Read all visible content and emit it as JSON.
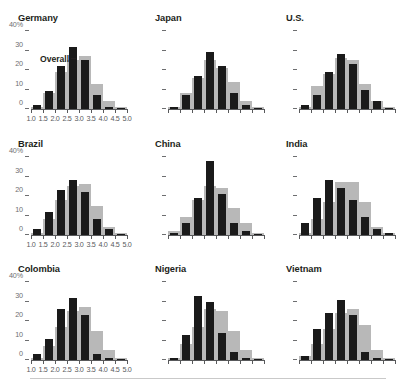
{
  "chart_data": {
    "type": "bar",
    "title": "",
    "xlabel": "",
    "ylabel": "",
    "ylim": [
      0,
      40
    ],
    "grid": false,
    "legend_position": "inline-annotation",
    "y_ticks": [
      {
        "value": 0,
        "label": "0"
      },
      {
        "value": 10,
        "label": "10"
      },
      {
        "value": 20,
        "label": "20"
      },
      {
        "value": 30,
        "label": "30"
      },
      {
        "value": 40,
        "label": "40%"
      }
    ],
    "x_ticks": [
      "1.0",
      "1.5",
      "2.0",
      "2.5",
      "3.0",
      "3.5",
      "4.0",
      "4.5",
      "5.0"
    ],
    "x_bins": [
      "1.0-1.5",
      "1.5-2.0",
      "2.0-2.5",
      "2.5-3.0",
      "3.0-3.5",
      "3.5-4.0",
      "4.0-4.5",
      "4.5-5.0"
    ],
    "series": [
      {
        "name": "Overall",
        "color": "#b8b8b8"
      },
      {
        "name": "Country",
        "color": "#1a1a1a"
      }
    ],
    "annotation": "Overall",
    "panels": [
      {
        "name": "Germany",
        "overall": [
          1,
          8,
          19,
          25,
          27,
          13,
          4,
          1
        ],
        "country": [
          2,
          9,
          22,
          32,
          25,
          7,
          1,
          0
        ]
      },
      {
        "name": "Japan",
        "overall": [
          1,
          8,
          16,
          25,
          21,
          14,
          4,
          1
        ],
        "country": [
          1,
          7,
          17,
          29,
          22,
          8,
          2,
          0
        ]
      },
      {
        "name": "U.S.",
        "overall": [
          1,
          12,
          18,
          26,
          25,
          13,
          4,
          1
        ],
        "country": [
          2,
          7,
          19,
          28,
          23,
          10,
          4,
          0
        ]
      },
      {
        "name": "Brazil",
        "overall": [
          1,
          8,
          18,
          25,
          26,
          15,
          4,
          1
        ],
        "country": [
          3,
          12,
          23,
          28,
          22,
          8,
          3,
          0
        ]
      },
      {
        "name": "China",
        "overall": [
          2,
          9,
          18,
          25,
          24,
          14,
          6,
          1
        ],
        "country": [
          1,
          6,
          19,
          38,
          21,
          6,
          2,
          0
        ]
      },
      {
        "name": "India",
        "overall": [
          1,
          8,
          17,
          27,
          27,
          17,
          4,
          1
        ],
        "country": [
          6,
          19,
          28,
          24,
          18,
          9,
          3,
          1
        ]
      },
      {
        "name": "Colombia",
        "overall": [
          1,
          7,
          17,
          25,
          27,
          15,
          5,
          1
        ],
        "country": [
          3,
          11,
          26,
          32,
          23,
          3,
          1,
          0
        ]
      },
      {
        "name": "Nigeria",
        "overall": [
          1,
          8,
          17,
          26,
          25,
          15,
          5,
          1
        ],
        "country": [
          1,
          13,
          33,
          30,
          14,
          4,
          1,
          0
        ]
      },
      {
        "name": "Vietnam",
        "overall": [
          2,
          8,
          16,
          24,
          26,
          18,
          5,
          1
        ],
        "country": [
          2,
          16,
          24,
          31,
          23,
          4,
          1,
          0
        ]
      }
    ]
  }
}
